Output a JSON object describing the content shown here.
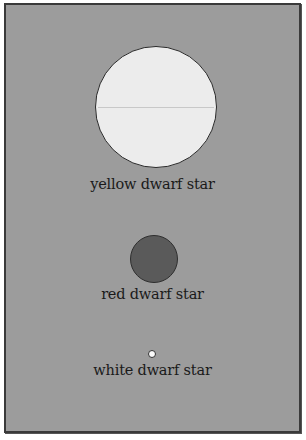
{
  "diagram": {
    "type": "star size comparison",
    "stars": [
      {
        "label": "yellow dwarf star",
        "relative_size": "large",
        "fill": "#ececec"
      },
      {
        "label": "red dwarf star",
        "relative_size": "medium",
        "fill": "#5a5a5a"
      },
      {
        "label": "white dwarf star",
        "relative_size": "tiny",
        "fill": "#fafafa"
      }
    ],
    "background": "#9c9c9c"
  }
}
